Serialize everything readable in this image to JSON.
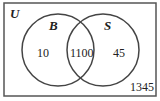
{
  "diagram": {
    "type": "venn",
    "universe_label": "U",
    "sets": [
      {
        "name": "B",
        "only_value": "10"
      },
      {
        "name": "S",
        "only_value": "45"
      }
    ],
    "intersection_value": "1100",
    "outside_value": "1345",
    "colors": {
      "stroke": "#444444",
      "background": "#ffffff",
      "text": "#222222"
    }
  }
}
